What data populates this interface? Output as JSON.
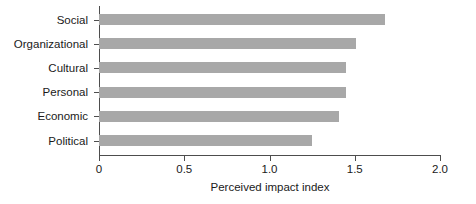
{
  "chart_data": {
    "type": "bar",
    "orientation": "horizontal",
    "title": "",
    "xlabel": "Perceived impact index",
    "ylabel": "",
    "categories": [
      "Social",
      "Organizational",
      "Cultural",
      "Personal",
      "Economic",
      "Political"
    ],
    "values": [
      1.68,
      1.51,
      1.45,
      1.45,
      1.41,
      1.25
    ],
    "xlim": [
      0,
      2.0
    ],
    "xticks": [
      0,
      0.5,
      1.0,
      1.5,
      2.0
    ],
    "xtick_labels": [
      "0",
      "0.5",
      "1.0",
      "1.5",
      "2.0"
    ],
    "grid": false,
    "legend": null,
    "bar_color": "#a8a8a8",
    "axis_color": "#4d4d4d",
    "background": "#ffffff"
  }
}
